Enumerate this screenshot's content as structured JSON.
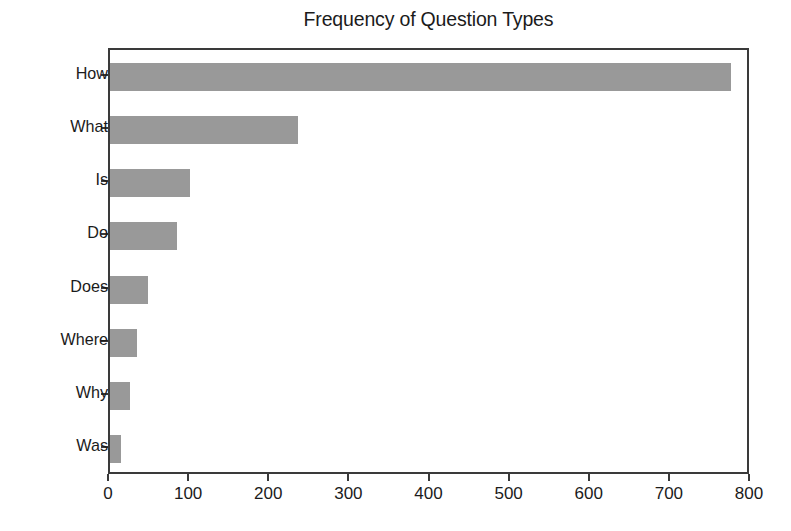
{
  "chart_data": {
    "type": "bar",
    "orientation": "horizontal",
    "title": "Frequency of Question Types",
    "xlabel": "",
    "ylabel": "",
    "categories": [
      "How",
      "What",
      "Is",
      "Do",
      "Does",
      "Where",
      "Why",
      "Was"
    ],
    "values": [
      775,
      235,
      100,
      84,
      47,
      34,
      25,
      14
    ],
    "xlim": [
      0,
      800
    ],
    "xticks": [
      0,
      100,
      200,
      300,
      400,
      500,
      600,
      700,
      800
    ],
    "xtick_labels": [
      "0",
      "100",
      "200",
      "300",
      "400",
      "500",
      "600",
      "700",
      "800"
    ],
    "ytick_labels": [
      "How",
      "What",
      "Is",
      "Do",
      "Does",
      "Where",
      "Why",
      "Was"
    ],
    "grid": false,
    "legend": null,
    "bar_color": "#999999",
    "axis_color": "#3a3a3a",
    "text_color": "#1b1b1b",
    "background": "#ffffff"
  }
}
